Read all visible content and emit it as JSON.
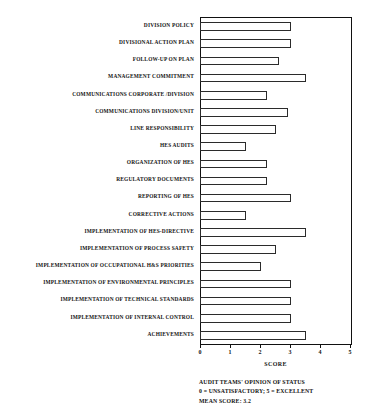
{
  "chart_data": {
    "type": "bar",
    "orientation": "horizontal",
    "title": "",
    "xlabel": "SCORE",
    "ylabel": "",
    "xlim": [
      0,
      5
    ],
    "xticks": [
      0,
      1,
      2,
      3,
      4,
      5
    ],
    "xtick_labels": [
      "0",
      "1",
      "2",
      "3",
      "4",
      "5"
    ],
    "grid": false,
    "legend": null,
    "bar_style": {
      "fill": "#ffffff",
      "edge": "#2b2b2b"
    },
    "categories": [
      "DIVISION POLICY",
      "DIVISIONAL ACTION PLAN",
      "FOLLOW-UP ON PLAN",
      "MANAGEMENT COMMITMENT",
      "COMMUNICATIONS CORPORATE /DIVISION",
      "COMMUNICATIONS DIVISION/UNIT",
      "LINE RESPONSIBILITY",
      "HES AUDITS",
      "ORGANIZATION OF HES",
      "REGULATORY DOCUMENTS",
      "REPORTING OF HES",
      "CORRECTIVE ACTIONS",
      "IMPLEMENTATION OF HES-DIRECTIVE",
      "IMPLEMENTATION OF PROCESS SAFETY",
      "IMPLEMENTATION OF OCCUPATIONAL H&S PRIORITIES",
      "IMPLEMENTATION OF ENVIRONMENTAL PRINCIPLES",
      "IMPLEMENTATION OF TECHNICAL STANDARDS",
      "IMPLEMENTATION OF INTERNAL CONTROL",
      "ACHIEVEMENTS"
    ],
    "values": [
      3.0,
      3.0,
      2.6,
      3.5,
      2.2,
      2.9,
      2.5,
      1.5,
      2.2,
      2.2,
      3.0,
      1.5,
      3.5,
      2.5,
      2.0,
      3.0,
      3.0,
      3.0,
      3.5
    ]
  },
  "caption": {
    "line1": "AUDIT TEAMS' OPINION OF STATUS",
    "line2": "0 = UNSATISFACTORY;  5 = EXCELLENT",
    "line3": "MEAN SCORE:  3.2"
  }
}
